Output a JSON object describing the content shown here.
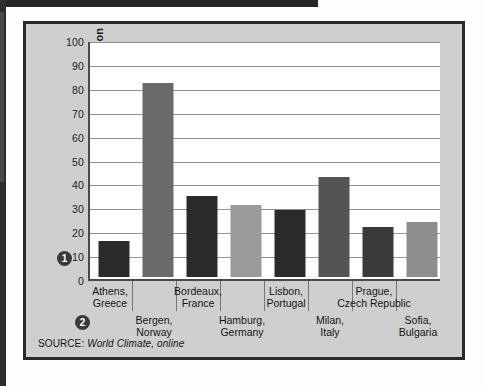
{
  "chart_data": {
    "type": "bar",
    "title": "",
    "xlabel": "",
    "ylabel": "Inches of Precipitation",
    "ylim": [
      0,
      100
    ],
    "ytick_step": 10,
    "grid": true,
    "legend": "none",
    "categories": [
      "Athens,\nGreece",
      "Bergen,\nNorway",
      "Bordeaux,\nFrance",
      "Hamburg,\nGermany",
      "Lisbon,\nPortugal",
      "Milan,\nItaly",
      "Prague,\nCzech Republic",
      "Sofia,\nBulgaria"
    ],
    "values": [
      15,
      81,
      34,
      30,
      28,
      42,
      21,
      23
    ],
    "bar_colors": [
      "#2b2b2b",
      "#6a6a6a",
      "#2b2b2b",
      "#9a9a9a",
      "#2b2b2b",
      "#545454",
      "#3a3a3a",
      "#8d8d8d"
    ],
    "ytick_labels": [
      "100",
      "90",
      "80",
      "70",
      "60",
      "50",
      "40",
      "30",
      "20",
      "10",
      "0"
    ],
    "bars": [
      {
        "city": "Athens",
        "country": "Greece",
        "line1": "Athens,",
        "line2": "Greece",
        "value": 15,
        "row": "top"
      },
      {
        "city": "Bergen",
        "country": "Norway",
        "line1": "Bergen,",
        "line2": "Norway",
        "value": 81,
        "row": "bottom"
      },
      {
        "city": "Bordeaux",
        "country": "France",
        "line1": "Bordeaux,",
        "line2": "France",
        "value": 34,
        "row": "top"
      },
      {
        "city": "Hamburg",
        "country": "Germany",
        "line1": "Hamburg,",
        "line2": "Germany",
        "value": 30,
        "row": "bottom"
      },
      {
        "city": "Lisbon",
        "country": "Portugal",
        "line1": "Lisbon,",
        "line2": "Portugal",
        "value": 28,
        "row": "top"
      },
      {
        "city": "Milan",
        "country": "Italy",
        "line1": "Milan,",
        "line2": "Italy",
        "value": 42,
        "row": "bottom"
      },
      {
        "city": "Prague",
        "country": "Czech Republic",
        "line1": "Prague,",
        "line2": "Czech Republic",
        "value": 21,
        "row": "top"
      },
      {
        "city": "Sofia",
        "country": "Bulgaria",
        "line1": "Sofia,",
        "line2": "Bulgaria",
        "value": 23,
        "row": "bottom"
      }
    ]
  },
  "callouts": {
    "one": "1",
    "two": "2"
  },
  "source": {
    "prefix": "SOURCE:",
    "reference": "World Climate, online"
  },
  "colors": {
    "panel_background": "#cfcfcf",
    "panel_border": "#2a2a2a",
    "plot_background": "#ffffff",
    "gridline": "#8f8f8f",
    "axis": "#4a4a4a",
    "text": "#141414",
    "callout_fill": "#3a3a3a"
  }
}
